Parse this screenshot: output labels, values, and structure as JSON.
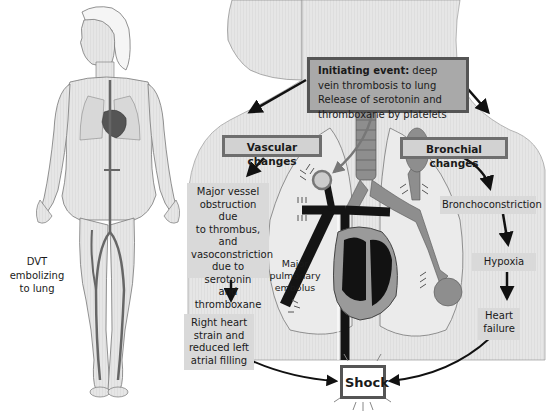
{
  "figure": {
    "left_caption": "DVT embolizing to lung",
    "left_caption_lines": [
      "DVT embolizing",
      "to lung"
    ]
  },
  "initiating_event": {
    "label": "Initiating event:",
    "line1_rest": " deep",
    "line2": "vein thrombosis to lung",
    "line3": "Release of serotonin and",
    "line4": "thromboxane by platelets"
  },
  "vascular": {
    "header": "Vascular changes",
    "step1_lines": [
      "Major vessel",
      "obstruction due",
      "to thrombus, and",
      "vasoconstriction",
      "due to serotonin",
      "and",
      "thromboxane"
    ],
    "step2_lines": [
      "Right heart",
      "strain and",
      "reduced left",
      "atrial filling"
    ]
  },
  "bronchial": {
    "header": "Bronchial changes",
    "step1": "Bronchoconstriction",
    "step2": "Hypoxia",
    "step3_lines": [
      "Heart",
      "failure"
    ]
  },
  "embolus_label_lines": [
    "Major",
    "pulmonary",
    "embolus"
  ],
  "outcome": "Shock",
  "colors": {
    "initiating_fill": "#a9a9a9",
    "header_fill": "#d2d2d2",
    "step_fill": "#d9d9d9",
    "border_dark": "#555555",
    "vessels": "#1a1a1a",
    "bronchi": "#8a8a8a",
    "skin": "#e4e4e4"
  }
}
